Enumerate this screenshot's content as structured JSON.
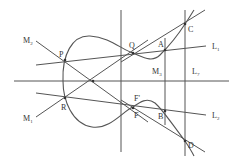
{
  "diagram": {
    "points": {
      "P": "P",
      "Q": "Q",
      "A": "A",
      "C": "C",
      "R": "R",
      "F": "F",
      "F_prime": "F'",
      "B": "B",
      "D": "D"
    },
    "lines": {
      "M2": {
        "base": "M",
        "sub": "2"
      },
      "M1": {
        "base": "M",
        "sub": "1"
      },
      "M3": {
        "base": "M",
        "sub": "3"
      },
      "L1": {
        "base": "L",
        "sub": "1"
      },
      "L2": {
        "base": "L",
        "sub": "2"
      },
      "L7": {
        "base": "L",
        "sub": "7"
      }
    },
    "colors": {
      "stroke": "#555555",
      "text": "#333333",
      "background": "#ffffff"
    }
  }
}
